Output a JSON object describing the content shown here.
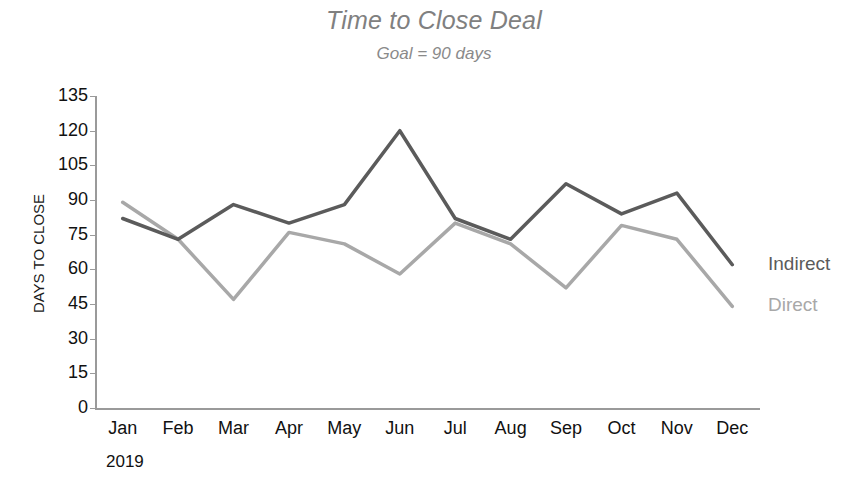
{
  "chart_data": {
    "type": "line",
    "title": "Time to Close Deal",
    "subtitle": "Goal = 90 days",
    "xlabel": "2019",
    "ylabel": "DAYS TO CLOSE",
    "categories": [
      "Jan",
      "Feb",
      "Mar",
      "Apr",
      "May",
      "Jun",
      "Jul",
      "Aug",
      "Sep",
      "Oct",
      "Nov",
      "Dec"
    ],
    "ylim": [
      0,
      135
    ],
    "ytick_values": [
      135,
      120,
      105,
      90,
      75,
      60,
      45,
      30,
      15,
      0
    ],
    "ytick_labels": [
      "135",
      "120",
      "105",
      "90",
      "75",
      "60",
      "45",
      "30",
      "15",
      "0"
    ],
    "grid": false,
    "legend_position": "right-end-of-lines",
    "goal_value": 90,
    "series": [
      {
        "name": "Indirect",
        "color": "#5b5b5b",
        "values": [
          82,
          73,
          88,
          80,
          88,
          120,
          82,
          73,
          97,
          84,
          93,
          62
        ]
      },
      {
        "name": "Direct",
        "color": "#a8a8a8",
        "values": [
          89,
          73,
          47,
          76,
          71,
          58,
          80,
          71,
          52,
          79,
          73,
          44
        ]
      }
    ]
  },
  "legend": {
    "indirect_label": "Indirect",
    "direct_label": "Direct"
  }
}
